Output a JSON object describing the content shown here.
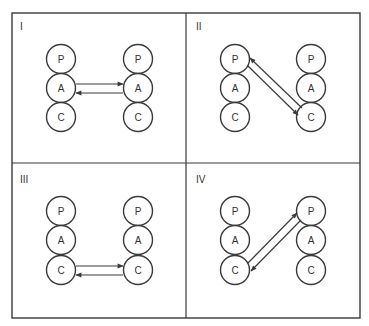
{
  "diagram": {
    "title": "",
    "colors": {
      "stroke": "#3a3a3a",
      "background": "#ffffff",
      "text": "#333333"
    },
    "frame": {
      "x": 12,
      "y": 13,
      "width": 348,
      "height": 305,
      "divider_x": 186,
      "divider_y": 163
    },
    "node_radius": 14.5,
    "quadrants": [
      {
        "id": "I",
        "label": "I",
        "label_pos": [
          20,
          30
        ],
        "columns": [
          {
            "x": 61,
            "nodes": [
              {
                "label": "P",
                "y": 59
              },
              {
                "label": "A",
                "y": 88
              },
              {
                "label": "C",
                "y": 117
              }
            ]
          },
          {
            "x": 138,
            "nodes": [
              {
                "label": "P",
                "y": 59
              },
              {
                "label": "A",
                "y": 88
              },
              {
                "label": "C",
                "y": 117
              }
            ]
          }
        ],
        "transaction": {
          "from": "A",
          "to": "A",
          "description": "Adult to Adult, complementary"
        },
        "arrows": [
          {
            "x1": 76,
            "y1": 84,
            "x2": 123,
            "y2": 84
          },
          {
            "x1": 123,
            "y1": 93,
            "x2": 76,
            "y2": 93
          }
        ]
      },
      {
        "id": "II",
        "label": "II",
        "label_pos": [
          196,
          30
        ],
        "columns": [
          {
            "x": 235,
            "nodes": [
              {
                "label": "P",
                "y": 59
              },
              {
                "label": "A",
                "y": 88
              },
              {
                "label": "C",
                "y": 117
              }
            ]
          },
          {
            "x": 311,
            "nodes": [
              {
                "label": "P",
                "y": 59
              },
              {
                "label": "A",
                "y": 88
              },
              {
                "label": "C",
                "y": 117
              }
            ]
          }
        ],
        "transaction": {
          "from": "P",
          "to": "C",
          "description": "Parent to Child, complementary"
        },
        "arrows": [
          {
            "x1": 248,
            "y1": 66,
            "x2": 298,
            "y2": 115
          },
          {
            "x1": 302,
            "y1": 108,
            "x2": 250,
            "y2": 58
          }
        ]
      },
      {
        "id": "III",
        "label": "III",
        "label_pos": [
          20,
          183
        ],
        "columns": [
          {
            "x": 61,
            "nodes": [
              {
                "label": "P",
                "y": 211
              },
              {
                "label": "A",
                "y": 240
              },
              {
                "label": "C",
                "y": 270
              }
            ]
          },
          {
            "x": 138,
            "nodes": [
              {
                "label": "P",
                "y": 211
              },
              {
                "label": "A",
                "y": 240
              },
              {
                "label": "C",
                "y": 270
              }
            ]
          }
        ],
        "transaction": {
          "from": "C",
          "to": "C",
          "description": "Child to Child, complementary"
        },
        "arrows": [
          {
            "x1": 76,
            "y1": 266,
            "x2": 123,
            "y2": 266
          },
          {
            "x1": 123,
            "y1": 275,
            "x2": 76,
            "y2": 275
          }
        ]
      },
      {
        "id": "IV",
        "label": "IV",
        "label_pos": [
          196,
          183
        ],
        "columns": [
          {
            "x": 235,
            "nodes": [
              {
                "label": "P",
                "y": 211
              },
              {
                "label": "A",
                "y": 240
              },
              {
                "label": "C",
                "y": 270
              }
            ]
          },
          {
            "x": 311,
            "nodes": [
              {
                "label": "P",
                "y": 211
              },
              {
                "label": "A",
                "y": 240
              },
              {
                "label": "C",
                "y": 270
              }
            ]
          }
        ],
        "transaction": {
          "from": "C",
          "to": "P",
          "description": "Child to Parent, complementary"
        },
        "arrows": [
          {
            "x1": 248,
            "y1": 263,
            "x2": 297,
            "y2": 213
          },
          {
            "x1": 301,
            "y1": 220,
            "x2": 251,
            "y2": 271
          }
        ]
      }
    ]
  }
}
